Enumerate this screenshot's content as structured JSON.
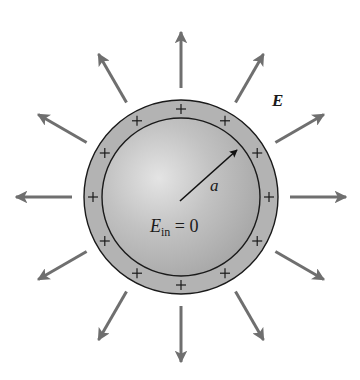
{
  "figure": {
    "field_label": "E",
    "radius_label": "a",
    "inside_label_main": "E",
    "inside_label_sub": "in",
    "inside_label_rest": " = 0",
    "charge_symbol": "+",
    "charge_count": 12,
    "field_arrow_count": 12,
    "angle_step_deg": 30
  },
  "geometry": {
    "center": [
      181,
      197
    ],
    "outer_radius": 97,
    "inner_radius": 79,
    "charge_ring_radius": 88,
    "arrow_start_r": 109,
    "arrow_end_r": 165
  },
  "colors": {
    "shell": "#b3b3b3",
    "sphere_highlight": "#e2e2e2",
    "sphere_base": "#b5b5b5",
    "sphere_edge": "#9c9c9c",
    "arrow": "#6f6f6f",
    "outline": "#1a1a1a"
  }
}
